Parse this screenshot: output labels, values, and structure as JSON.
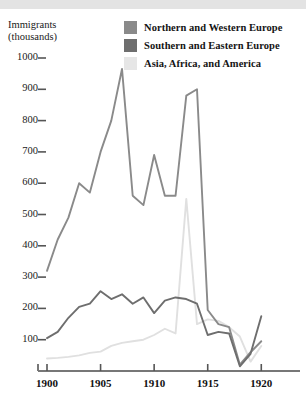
{
  "figure": {
    "y_axis_title": "Immigrants\n(thousands)"
  },
  "legend": {
    "position": "top-right",
    "items": [
      {
        "label": "Northern and Western Europe",
        "color": "#8a8a8a",
        "swatch_name": "legend-swatch-northern-western-europe"
      },
      {
        "label": "Southern and Eastern Europe",
        "color": "#6e6e6e",
        "swatch_name": "legend-swatch-southern-eastern-europe"
      },
      {
        "label": "Asia, Africa, and America",
        "color": "#e0e0e0",
        "swatch_name": "legend-swatch-asia-africa-america"
      }
    ]
  },
  "caption": "",
  "chart_data": {
    "type": "line",
    "title": "",
    "xlabel": "",
    "ylabel": "Immigrants (thousands)",
    "xlim": [
      1900,
      1921
    ],
    "ylim": [
      0,
      1050
    ],
    "grid": false,
    "y_ticks": [
      100,
      200,
      300,
      400,
      500,
      600,
      700,
      800,
      900,
      1000
    ],
    "x_ticks": [
      1900,
      1905,
      1910,
      1915,
      1920
    ],
    "x": [
      1900,
      1901,
      1902,
      1903,
      1904,
      1905,
      1906,
      1907,
      1908,
      1909,
      1910,
      1911,
      1912,
      1913,
      1914,
      1915,
      1916,
      1917,
      1918,
      1919,
      1920
    ],
    "series": [
      {
        "name": "Northern and Western Europe",
        "color": "#8a8a8a",
        "values": [
          320,
          420,
          490,
          600,
          570,
          700,
          800,
          965,
          560,
          530,
          690,
          560,
          560,
          880,
          900,
          195,
          150,
          140,
          20,
          60,
          95
        ]
      },
      {
        "name": "Southern and Eastern Europe",
        "color": "#6e6e6e",
        "values": [
          105,
          125,
          170,
          205,
          215,
          255,
          230,
          245,
          215,
          235,
          185,
          225,
          235,
          230,
          215,
          115,
          125,
          120,
          15,
          55,
          175
        ]
      },
      {
        "name": "Asia, Africa, and America",
        "color": "#e0e0e0",
        "values": [
          40,
          42,
          45,
          50,
          58,
          62,
          80,
          90,
          95,
          100,
          115,
          135,
          120,
          550,
          150,
          165,
          160,
          140,
          110,
          30,
          80
        ]
      }
    ]
  }
}
